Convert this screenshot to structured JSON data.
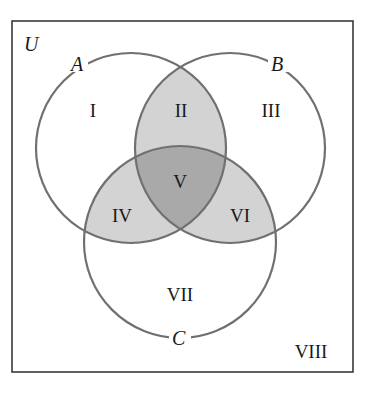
{
  "diagram": {
    "type": "venn-3-set",
    "universe_label": "U",
    "sets": [
      {
        "name": "A",
        "label": "A"
      },
      {
        "name": "B",
        "label": "B"
      },
      {
        "name": "C",
        "label": "C"
      }
    ],
    "regions": [
      {
        "id": "I",
        "label": "I",
        "description": "A only",
        "shaded": false
      },
      {
        "id": "II",
        "label": "II",
        "description": "A and B, not C",
        "shaded": true
      },
      {
        "id": "III",
        "label": "III",
        "description": "B only",
        "shaded": false
      },
      {
        "id": "IV",
        "label": "IV",
        "description": "A and C, not B",
        "shaded": true
      },
      {
        "id": "V",
        "label": "V",
        "description": "A and B and C",
        "shaded": true
      },
      {
        "id": "VI",
        "label": "VI",
        "description": "B and C, not A",
        "shaded": true
      },
      {
        "id": "VII",
        "label": "VII",
        "description": "C only",
        "shaded": false
      },
      {
        "id": "VIII",
        "label": "VIII",
        "description": "outside A, B, C",
        "shaded": false
      }
    ],
    "colors": {
      "stroke": "#707070",
      "border": "#3a3a3a",
      "light_shade": "#d3d3d3",
      "dark_shade": "#a9a9a9",
      "background": "#ffffff"
    }
  }
}
